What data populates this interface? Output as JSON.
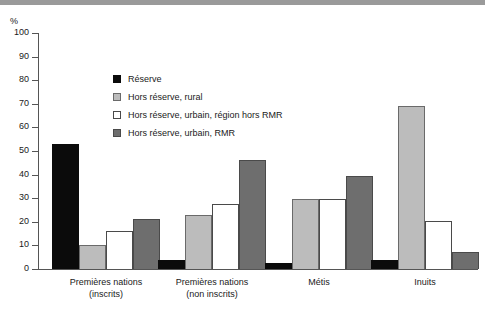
{
  "chart_data": {
    "type": "bar",
    "title": "",
    "subtitle": "",
    "xlabel": "",
    "ylabel": "%",
    "ylim": [
      0,
      100
    ],
    "ytick_step": 10,
    "yticks": [
      100,
      90,
      80,
      70,
      60,
      50,
      40,
      30,
      20,
      10,
      0
    ],
    "grid": false,
    "legend_position": "inside-top-center",
    "categories": [
      "Premières nations (inscrits)",
      "Premières nations (non inscrits)",
      "Métis",
      "Inuits"
    ],
    "category_lines": [
      [
        "Premières nations",
        "(inscrits)"
      ],
      [
        "Premières nations",
        "(non inscrits)"
      ],
      [
        "Métis",
        ""
      ],
      [
        "Inuits",
        ""
      ]
    ],
    "series": [
      {
        "name": "Réserve",
        "color": "#0b0b0b",
        "values": [
          53,
          4,
          2.5,
          4
        ]
      },
      {
        "name": "Hors réserve, rural",
        "color": "#bcbcbc",
        "values": [
          10,
          23,
          29.5,
          69
        ]
      },
      {
        "name": "Hors réserve, urbain, région hors RMR",
        "color": "#ffffff",
        "values": [
          16,
          27.5,
          29.5,
          20.5
        ]
      },
      {
        "name": "Hors réserve, urbain, RMR",
        "color": "#6e6e6e",
        "values": [
          21,
          46,
          39.5,
          7
        ]
      }
    ]
  },
  "axis": {
    "unit_label": "%"
  },
  "legend": {
    "items": [
      {
        "label": "Réserve"
      },
      {
        "label": "Hors réserve, rural"
      },
      {
        "label": "Hors réserve, urbain, région hors RMR"
      },
      {
        "label": "Hors réserve, urbain, RMR"
      }
    ]
  }
}
